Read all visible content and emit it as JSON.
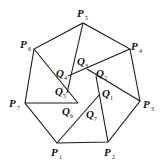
{
  "diagram": {
    "type": "geometry-figure",
    "outer_polygon": [
      "P1",
      "P2",
      "P3",
      "P4",
      "P5",
      "P6",
      "P7"
    ],
    "inner_points": [
      "Q1",
      "Q2",
      "Q3",
      "Q4",
      "Q5",
      "Q6",
      "Q7"
    ],
    "labels": {
      "P1": {
        "letter": "P",
        "sub": "1"
      },
      "P2": {
        "letter": "P",
        "sub": "2"
      },
      "P3": {
        "letter": "P",
        "sub": "3"
      },
      "P4": {
        "letter": "P",
        "sub": "4"
      },
      "P5": {
        "letter": "P",
        "sub": "5"
      },
      "P6": {
        "letter": "P",
        "sub": "6"
      },
      "P7": {
        "letter": "P",
        "sub": "7"
      },
      "Q1": {
        "letter": "Q",
        "sub": "1"
      },
      "Q2": {
        "letter": "Q",
        "sub": "2"
      },
      "Q3": {
        "letter": "Q",
        "sub": "3"
      },
      "Q4": {
        "letter": "Q",
        "sub": "4"
      },
      "Q5": {
        "letter": "Q",
        "sub": "5"
      },
      "Q6": {
        "letter": "Q",
        "sub": "6"
      },
      "Q7": {
        "letter": "Q",
        "sub": "7"
      }
    },
    "segments": [
      [
        "P1",
        "Q1"
      ],
      [
        "P2",
        "Q2"
      ],
      [
        "P3",
        "Q3"
      ],
      [
        "P4",
        "Q4"
      ],
      [
        "P5",
        "Q5"
      ],
      [
        "P6",
        "Q6"
      ],
      [
        "P7",
        "Q7"
      ]
    ]
  }
}
